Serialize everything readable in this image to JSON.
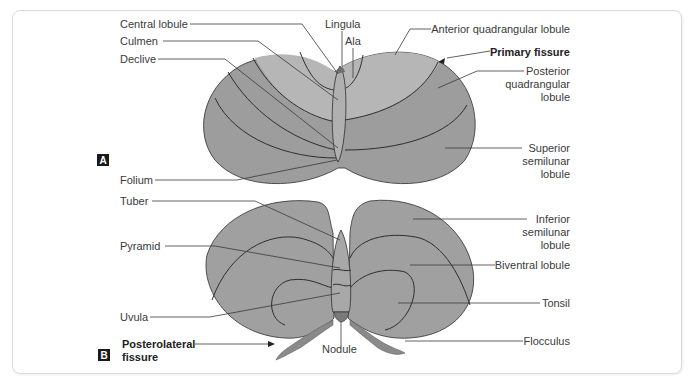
{
  "figure": {
    "panels": [
      {
        "id": "A",
        "view": "superior",
        "labels_left": [
          {
            "text": "Central lobule"
          },
          {
            "text": "Culmen"
          },
          {
            "text": "Declive"
          },
          {
            "text": "Folium"
          }
        ],
        "labels_top": [
          {
            "text": "Lingula"
          },
          {
            "text": "Ala"
          }
        ],
        "labels_right": [
          {
            "text": "Anterior quadrangular lobule"
          },
          {
            "text": "Primary fissure",
            "bold": true
          },
          {
            "lines": [
              "Posterior",
              "quadrangular",
              "lobule"
            ]
          },
          {
            "lines": [
              "Superior",
              "semilunar",
              "lobule"
            ]
          }
        ]
      },
      {
        "id": "B",
        "view": "inferior",
        "labels_left": [
          {
            "text": "Tuber"
          },
          {
            "text": "Pyramid"
          },
          {
            "text": "Uvula"
          },
          {
            "lines": [
              "Posterolateral",
              "fissure"
            ],
            "bold": true
          }
        ],
        "labels_bottom": [
          {
            "text": "Nodule"
          }
        ],
        "labels_right": [
          {
            "lines": [
              "Inferior",
              "semilunar",
              "lobule"
            ]
          },
          {
            "text": "Biventral lobule"
          },
          {
            "text": "Tonsil"
          },
          {
            "text": "Flocculus"
          }
        ]
      }
    ],
    "colors": {
      "anterior_lobe": "#b6b6b6",
      "posterior_lobe": "#9d9d9d",
      "inferior_surface": "#a0a0a0",
      "lingula_nodule": "#7a7a7a",
      "lines": "#2e2e2e",
      "badge": "#1a1a1a",
      "frame_border": "#dcdcdc"
    }
  }
}
